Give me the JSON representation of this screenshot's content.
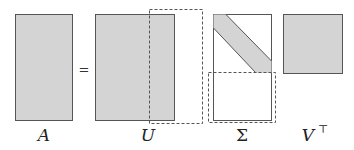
{
  "diagram": {
    "equation_sign": "=",
    "colors": {
      "fill": "#d4d4d4",
      "stroke": "#555555",
      "dashed": "#555555"
    },
    "matrices": [
      {
        "id": "A",
        "label": "A"
      },
      {
        "id": "U",
        "label": "U"
      },
      {
        "id": "Sigma",
        "label": "Σ"
      },
      {
        "id": "Vt",
        "label": "V",
        "superscript": "⊤"
      }
    ]
  }
}
